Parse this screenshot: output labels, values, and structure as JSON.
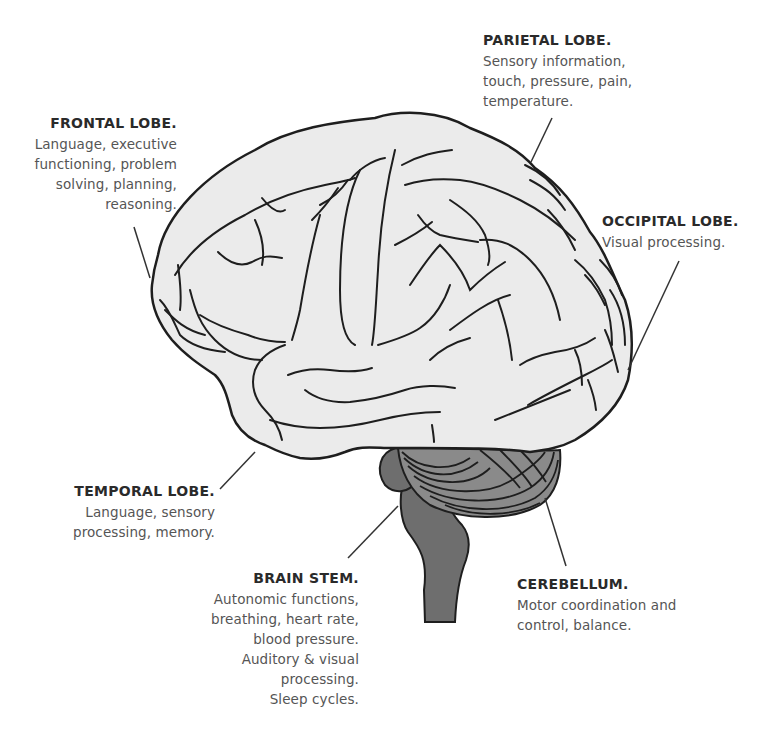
{
  "diagram": {
    "colors": {
      "cerebrum_fill": "#ebebeb",
      "outline": "#1e1e1e",
      "cerebellum_fill": "#8a8a8a",
      "brainstem_fill": "#6e6e6e",
      "heading_text": "#2a2a2a",
      "body_text": "#555555",
      "leader_line": "#333333"
    },
    "labels": [
      {
        "id": "parietal",
        "title": "PARIETAL LOBE.",
        "lines": [
          "Sensory information,",
          "touch, pressure, pain,",
          "temperature."
        ]
      },
      {
        "id": "frontal",
        "title": "FRONTAL LOBE.",
        "lines": [
          "Language, executive",
          "functioning, problem",
          "solving, planning,",
          "reasoning."
        ]
      },
      {
        "id": "occipital",
        "title": "OCCIPITAL LOBE.",
        "lines": [
          "Visual processing."
        ]
      },
      {
        "id": "temporal",
        "title": "TEMPORAL LOBE.",
        "lines": [
          "Language, sensory",
          "processing, memory."
        ]
      },
      {
        "id": "brainstem",
        "title": "BRAIN STEM.",
        "lines": [
          "Autonomic functions,",
          "breathing, heart rate,",
          "blood pressure.",
          "Auditory & visual",
          "processing.",
          "Sleep cycles."
        ]
      },
      {
        "id": "cerebellum",
        "title": "CEREBELLUM.",
        "lines": [
          "Motor coordination and",
          "control, balance."
        ]
      }
    ]
  }
}
